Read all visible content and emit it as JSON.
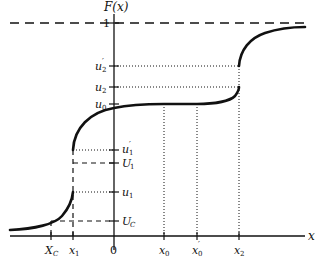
{
  "diagram": {
    "type": "cumulative distribution function plot",
    "colors": {
      "ink": "#111111",
      "background": "#ffffff"
    },
    "axes": {
      "y_label": "F(x)",
      "x_label": "x",
      "y_top_tick": "1",
      "origin_label": "0"
    },
    "y_ticks_left": [
      {
        "id": "u2p",
        "base": "u",
        "sub": "2",
        "prime": true
      },
      {
        "id": "u2",
        "base": "u",
        "sub": "2",
        "prime": false
      },
      {
        "id": "u0",
        "base": "u",
        "sub": "0",
        "prime": false
      }
    ],
    "y_ticks_right": [
      {
        "id": "u1p",
        "base": "u",
        "sub": "1",
        "prime": true
      },
      {
        "id": "U1",
        "base": "U",
        "sub": "1",
        "prime": false
      },
      {
        "id": "u1",
        "base": "u",
        "sub": "1",
        "prime": false
      },
      {
        "id": "UC",
        "base": "U",
        "sub": "C",
        "prime": false
      }
    ],
    "x_ticks": [
      {
        "id": "XC",
        "base": "X",
        "sub": "C",
        "prime": false
      },
      {
        "id": "x1",
        "base": "x",
        "sub": "1",
        "prime": false
      },
      {
        "id": "x0",
        "base": "x",
        "sub": "0",
        "prime": false
      },
      {
        "id": "x0p",
        "base": "x",
        "sub": "0",
        "prime": true
      },
      {
        "id": "x2",
        "base": "x",
        "sub": "2",
        "prime": false
      }
    ],
    "features": [
      "asymptote F=1 dashed",
      "jump discontinuity at x1 from u1 to u1'",
      "flat region between x0 and x0' at level u0",
      "jump discontinuity at x2 from u2 to u2'"
    ]
  },
  "labels": {
    "Fx": "F(x)",
    "x": "x",
    "one": "1",
    "zero": "0",
    "u": "u",
    "U": "U",
    "X": "X",
    "xs": "x",
    "s0": "0",
    "s1": "1",
    "s2": "2",
    "sC": "C",
    "prime": "′"
  }
}
